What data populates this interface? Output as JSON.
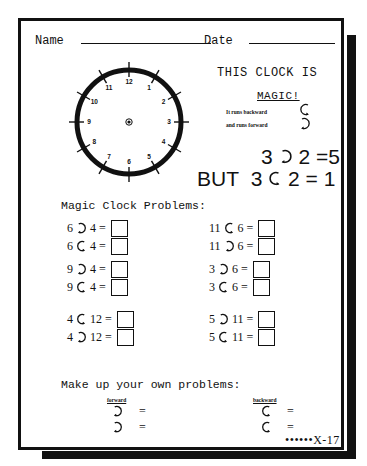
{
  "header": {
    "name_label": "Name",
    "date_label": "Date"
  },
  "clock": {
    "numbers": [
      "12",
      "1",
      "2",
      "3",
      "4",
      "5",
      "6",
      "7",
      "8",
      "9",
      "10",
      "11"
    ]
  },
  "intro": {
    "line1": "THIS CLOCK IS",
    "line2": "MAGIC!",
    "note_backward": "It runs backward",
    "note_forward": "and runs forward",
    "icon_backward": "counterclockwise-arrow-icon",
    "icon_forward": "clockwise-arrow-icon"
  },
  "examples": [
    {
      "prefix": "",
      "a": "3",
      "op": "forward",
      "b": "2",
      "result": "5"
    },
    {
      "prefix": "BUT",
      "a": "3",
      "op": "backward",
      "b": "2",
      "result": "1"
    }
  ],
  "problems_title": "Magic Clock Problems:",
  "problems": {
    "left": [
      {
        "a": "6",
        "op": "forward",
        "b": "4"
      },
      {
        "a": "6",
        "op": "backward",
        "b": "4"
      },
      {
        "a": "9",
        "op": "forward",
        "b": "4"
      },
      {
        "a": "9",
        "op": "backward",
        "b": "4"
      },
      {
        "a": "4",
        "op": "backward",
        "b": "12"
      },
      {
        "a": "4",
        "op": "forward",
        "b": "12"
      }
    ],
    "right": [
      {
        "a": "11",
        "op": "backward",
        "b": "6"
      },
      {
        "a": "11",
        "op": "forward",
        "b": "6"
      },
      {
        "a": "3",
        "op": "forward",
        "b": "6"
      },
      {
        "a": "3",
        "op": "backward",
        "b": "6"
      },
      {
        "a": "5",
        "op": "forward",
        "b": "11"
      },
      {
        "a": "5",
        "op": "backward",
        "b": "11"
      }
    ]
  },
  "make_your_own": {
    "title": "Make up your own problems:",
    "forward_label": "forward",
    "backward_label": "backward",
    "equals": "="
  },
  "page_number": "••••••X-17"
}
